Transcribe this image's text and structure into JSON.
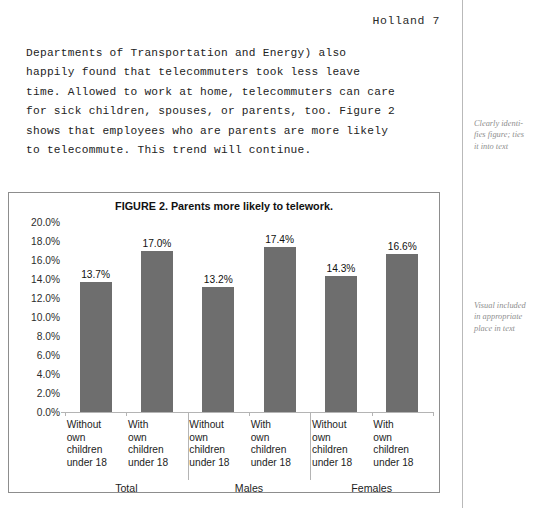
{
  "document": {
    "running_head": "Holland 7",
    "body_text": "Departments of Transportation and Energy) also\nhappily found that telecommuters took less leave\ntime. Allowed to work at home, telecommuters can care\nfor sick children, spouses, or parents, too. Figure 2\nshows that employees who are parents are more likely\nto telecommute. This trend will continue."
  },
  "annotations": [
    {
      "text": "Clearly identi-\nfies figure; ties\nit into text"
    },
    {
      "text": "Visual included\nin appropriate\nplace in text"
    }
  ],
  "chart_data": {
    "type": "bar",
    "title": "FIGURE 2. Parents more likely to telework.",
    "xlabel": "",
    "ylabel": "",
    "ylim": [
      0,
      20
    ],
    "grid": false,
    "legend": "none",
    "bar_color": "#6e6e6e",
    "categories": [
      "Without\nown\nchildren\nunder 18",
      "With\nown\nchildren\nunder 18",
      "Without\nown\nchildren\nunder 18",
      "With\nown\nchildren\nunder 18",
      "Without\nown\nchildren\nunder 18",
      "With\nown\nchildren\nunder 18"
    ],
    "values": [
      13.7,
      17.0,
      13.2,
      17.4,
      14.3,
      16.6
    ],
    "data_labels": [
      "13.7%",
      "17.0%",
      "13.2%",
      "17.4%",
      "14.3%",
      "16.6%"
    ],
    "groups": [
      {
        "label": "Total",
        "categories": [
          0,
          1
        ]
      },
      {
        "label": "Males",
        "categories": [
          2,
          3
        ]
      },
      {
        "label": "Females",
        "categories": [
          4,
          5
        ]
      }
    ],
    "ytick_values": [
      20,
      18,
      16,
      14,
      12,
      10,
      8,
      6,
      4,
      2,
      0
    ],
    "ytick_labels": [
      "20.0%",
      "18.0%",
      "16.0%",
      "14.0%",
      "12.0%",
      "10.0%",
      "8.0%",
      "6.0%",
      "4.0%",
      "2.0%",
      "0.0%"
    ]
  }
}
